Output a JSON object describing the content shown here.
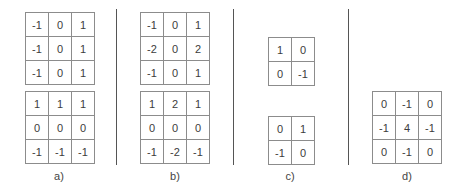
{
  "panels": [
    {
      "label": "a)",
      "kernels": [
        [
          [
            "-1",
            "0",
            "1"
          ],
          [
            "-1",
            "0",
            "1"
          ],
          [
            "-1",
            "0",
            "1"
          ]
        ],
        [
          [
            "1",
            "1",
            "1"
          ],
          [
            "0",
            "0",
            "0"
          ],
          [
            "-1",
            "-1",
            "-1"
          ]
        ]
      ]
    },
    {
      "label": "b)",
      "kernels": [
        [
          [
            "-1",
            "0",
            "1"
          ],
          [
            "-2",
            "0",
            "2"
          ],
          [
            "-1",
            "0",
            "1"
          ]
        ],
        [
          [
            "1",
            "2",
            "1"
          ],
          [
            "0",
            "0",
            "0"
          ],
          [
            "-1",
            "-2",
            "-1"
          ]
        ]
      ]
    },
    {
      "label": "c)",
      "kernels": [
        [
          [
            "1",
            "0"
          ],
          [
            "0",
            "-1"
          ]
        ],
        [
          [
            "0",
            "1"
          ],
          [
            "-1",
            "0"
          ]
        ]
      ]
    },
    {
      "label": "d)",
      "kernels": [
        [
          [
            "0",
            "-1",
            "0"
          ],
          [
            "-1",
            "4",
            "-1"
          ],
          [
            "0",
            "-1",
            "0"
          ]
        ]
      ]
    }
  ],
  "colors": {
    "border": "#8c8c8c",
    "text": "#3c3c3c",
    "divider": "#555555"
  }
}
